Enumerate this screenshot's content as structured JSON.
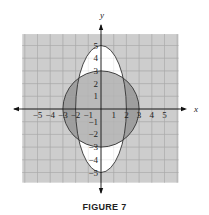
{
  "caption": "FIGURE 7",
  "colors": {
    "grid_bg": "#cdcdcd",
    "grid_line": "#a9a9a9",
    "circle_only": "#9e9e9e",
    "overlap": "#b9b9b9",
    "ellipse_only": "#ffffff",
    "stroke": "#333333"
  },
  "chart_data": {
    "type": "region-plot",
    "title": "FIGURE 7",
    "xlabel": "x",
    "ylabel": "y",
    "xlim": [
      -6,
      6
    ],
    "ylim": [
      -6,
      6
    ],
    "grid": true,
    "x_ticks": [
      -5,
      -4,
      -3,
      -2,
      -1,
      1,
      2,
      3,
      4,
      5
    ],
    "y_ticks": [
      5,
      4,
      3,
      2,
      1,
      -1,
      -2,
      -3,
      -4,
      -5
    ],
    "curves": [
      {
        "name": "circle",
        "equation": "x^2 + y^2 = 9",
        "center": [
          0,
          0
        ],
        "rx": 3,
        "ry": 3,
        "fill": "dark gray"
      },
      {
        "name": "ellipse",
        "equation": "x^2/4 + y^2/25 = 1",
        "center": [
          0,
          0
        ],
        "rx": 2,
        "ry": 5,
        "fill": "white"
      }
    ],
    "shaded_regions": [
      "inside circle",
      "outside ellipse and inside grid (light gray)"
    ]
  },
  "layout": {
    "origin_x": 101,
    "origin_y": 109,
    "unit": 12.7
  }
}
